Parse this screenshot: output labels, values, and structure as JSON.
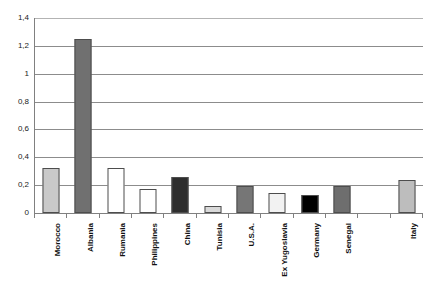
{
  "chart_data": {
    "type": "bar",
    "title": "",
    "subtitle": "",
    "xlabel": "",
    "ylabel": "",
    "categories": [
      "Morocco",
      "Albania",
      "Rumania",
      "Philippines",
      "China",
      "Tunisia",
      "U.S.A.",
      "Ex Yugoslavia",
      "Germany",
      "Senegal",
      "",
      "Italy"
    ],
    "values": [
      0.32,
      1.25,
      0.32,
      0.175,
      0.26,
      0.05,
      0.195,
      0.145,
      0.13,
      0.195,
      null,
      0.235
    ],
    "bar_colors": [
      "#c9c9c9",
      "#707070",
      "#ffffff",
      "#ffffff",
      "#2e2e2e",
      "#d9d9d9",
      "#767676",
      "#f2f2f2",
      "#000000",
      "#6e6e6e",
      "",
      "#bdbdbd"
    ],
    "ylim": [
      0,
      1.4
    ],
    "ytick_labels": [
      "0",
      "0,2",
      "0,4",
      "0,6",
      "0,8",
      "1",
      "1,2",
      "1,4"
    ],
    "ytick_values": [
      0,
      0.2,
      0.4,
      0.6,
      0.8,
      1,
      1.2,
      1.4
    ],
    "grid": true,
    "legend": false,
    "decimal_separator": ","
  },
  "axis": {
    "line_color": "#808080",
    "grid_color": "#8c8c8c"
  }
}
